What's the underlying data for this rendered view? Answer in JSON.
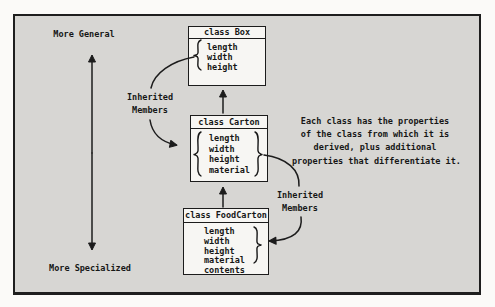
{
  "figure": {
    "axis": {
      "top_label": "More General",
      "bottom_label": "More Specialized"
    },
    "classes": [
      {
        "title": "class Box",
        "members": [
          "length",
          "width",
          "height"
        ]
      },
      {
        "title": "class Carton",
        "members": [
          "length",
          "width",
          "height",
          "material"
        ]
      },
      {
        "title": "class FoodCarton",
        "members": [
          "length",
          "width",
          "height",
          "material",
          "contents"
        ]
      }
    ],
    "annotations": {
      "inherited_left": {
        "line1": "Inherited",
        "line2": "Members"
      },
      "inherited_right": {
        "line1": "Inherited",
        "line2": "Members"
      },
      "description_lines": [
        "Each class has the properties",
        "of the class from which it is",
        "derived, plus additional",
        "properties that differentiate it."
      ]
    },
    "colors": {
      "frame_background": "#d7d6d3",
      "page_background": "#fbfaf8",
      "box_fill": "#f7f6f3",
      "ink": "#1c1c1c"
    }
  }
}
